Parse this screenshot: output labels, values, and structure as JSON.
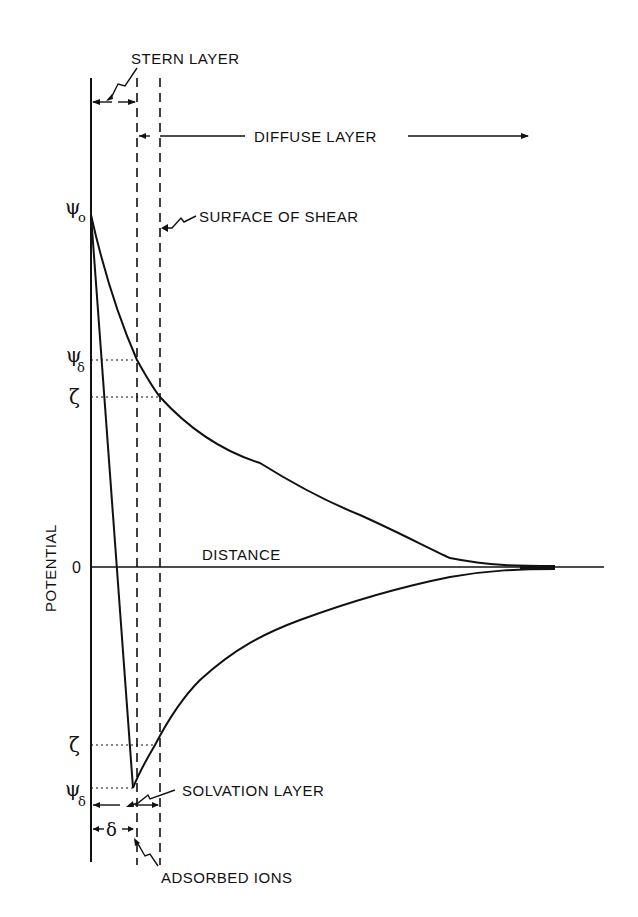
{
  "diagram": {
    "labels": {
      "stern_layer": "STERN LAYER",
      "diffuse_layer": "DIFFUSE LAYER",
      "surface_of_shear": "SURFACE OF SHEAR",
      "distance": "DISTANCE",
      "potential": "POTENTIAL",
      "solvation_layer": "SOLVATION LAYER",
      "adsorbed_ions": "ADSORBED IONS"
    },
    "symbols": {
      "psi0_main": "ψ",
      "psi0_sub": "o",
      "psi_delta_top_main": "ψ",
      "psi_delta_top_sub": "δ",
      "zeta_top": "ζ",
      "zero": "0",
      "zeta_bottom": "ζ",
      "psi_delta_bottom_main": "ψ",
      "psi_delta_bottom_sub": "δ",
      "delta": "δ"
    },
    "colors": {
      "ink": "#111111",
      "background": "#ffffff"
    }
  }
}
